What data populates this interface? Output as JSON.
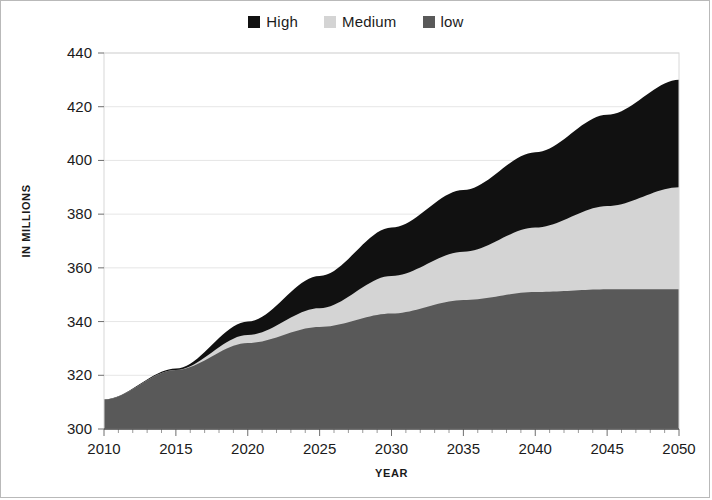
{
  "legend": {
    "position": "top-center",
    "items": [
      {
        "label": "High",
        "color": "#111111",
        "swatch_icon": "square-swatch-icon"
      },
      {
        "label": "Medium",
        "color": "#d4d4d4",
        "swatch_icon": "square-swatch-icon"
      },
      {
        "label": "low",
        "color": "#595959",
        "swatch_icon": "square-swatch-icon"
      }
    ]
  },
  "axes": {
    "x_title": "YEAR",
    "y_title": "IN MILLIONS",
    "x_ticks": [
      "2010",
      "2015",
      "2020",
      "2025",
      "2030",
      "2035",
      "2040",
      "2045",
      "2050"
    ],
    "y_ticks": [
      "300",
      "320",
      "340",
      "360",
      "380",
      "400",
      "420",
      "440"
    ]
  },
  "chart_data": {
    "type": "area",
    "stacked": true,
    "title": "",
    "subtitle": "",
    "xlabel": "YEAR",
    "ylabel": "IN MILLIONS",
    "xlim": [
      2010,
      2050
    ],
    "ylim": [
      300,
      440
    ],
    "x_tick_step": 5,
    "y_tick_step": 20,
    "minor_x_ticks": true,
    "grid": true,
    "grid_axis": "y",
    "legend_position": "top-center",
    "x": [
      2010,
      2015,
      2020,
      2025,
      2030,
      2035,
      2040,
      2045,
      2050
    ],
    "series": [
      {
        "name": "low",
        "color": "#595959",
        "values": [
          311,
          322,
          332,
          338,
          343,
          348,
          351,
          352,
          352
        ]
      },
      {
        "name": "Medium",
        "color": "#d4d4d4",
        "values": [
          311,
          322,
          335,
          345,
          357,
          366,
          375,
          383,
          390
        ]
      },
      {
        "name": "High",
        "color": "#111111",
        "values": [
          311,
          322.5,
          340,
          357,
          375,
          389,
          403,
          417,
          430
        ]
      }
    ],
    "note": "series values are cumulative upper boundaries of each stacked band"
  }
}
